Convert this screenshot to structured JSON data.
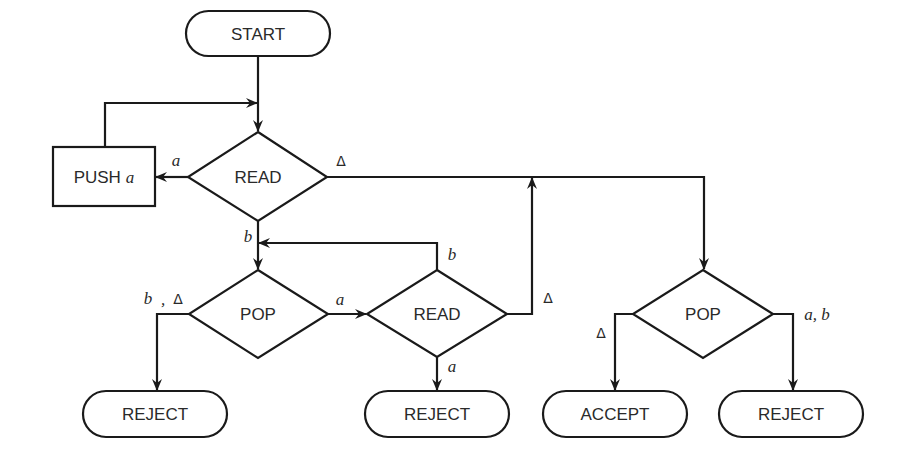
{
  "diagram": {
    "type": "flowchart",
    "nodes": {
      "start": {
        "label": "START",
        "shape": "terminal"
      },
      "read1": {
        "label": "READ",
        "shape": "decision"
      },
      "push_a": {
        "label": "PUSH",
        "var": "a",
        "shape": "process"
      },
      "pop1": {
        "label": "POP",
        "shape": "decision"
      },
      "read2": {
        "label": "READ",
        "shape": "decision"
      },
      "pop2": {
        "label": "POP",
        "shape": "decision"
      },
      "reject1": {
        "label": "REJECT",
        "shape": "terminal"
      },
      "reject2": {
        "label": "REJECT",
        "shape": "terminal"
      },
      "accept": {
        "label": "ACCEPT",
        "shape": "terminal"
      },
      "reject3": {
        "label": "REJECT",
        "shape": "terminal"
      }
    },
    "edge_labels": {
      "read1_to_push": "a",
      "read1_to_pop2": "Δ",
      "read1_to_pop1": "b",
      "pop1_to_reject1_b": "b",
      "pop1_to_reject1_sep": ",",
      "pop1_to_reject1_delta": "Δ",
      "pop1_to_read2": "a",
      "read2_to_pop1": "b",
      "read2_to_reject2": "a",
      "read2_to_pop2": "Δ",
      "pop2_to_accept": "Δ",
      "pop2_to_reject3": "a, b"
    }
  }
}
